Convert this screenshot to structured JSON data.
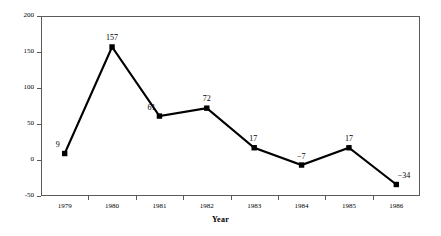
{
  "chart_data": {
    "type": "line",
    "title": "",
    "subtitle": "",
    "xlabel": "Year",
    "ylabel": "",
    "categories": [
      "1979",
      "1980",
      "1981",
      "1982",
      "1983",
      "1984",
      "1985",
      "1986"
    ],
    "values": [
      9,
      157,
      61,
      72,
      17,
      -7,
      17,
      -34
    ],
    "point_labels": [
      "9",
      "157",
      "61",
      "72",
      "17",
      "−7",
      "17",
      "−34"
    ],
    "series": [
      {
        "name": "",
        "values": [
          9,
          157,
          61,
          72,
          17,
          -7,
          17,
          -34
        ]
      }
    ],
    "ylim": [
      -50,
      200
    ],
    "yticks": [
      -50,
      0,
      50,
      100,
      150,
      200
    ],
    "ytick_labels": [
      "-50",
      "0",
      "50",
      "100",
      "150",
      "200"
    ],
    "grid": false,
    "legend": "none",
    "line_color": "#000000",
    "marker": "square",
    "marker_color": "#000000",
    "frame_color": "#5a5a5a",
    "background": "#ffffff"
  },
  "axis": {
    "x_title": "Year"
  }
}
